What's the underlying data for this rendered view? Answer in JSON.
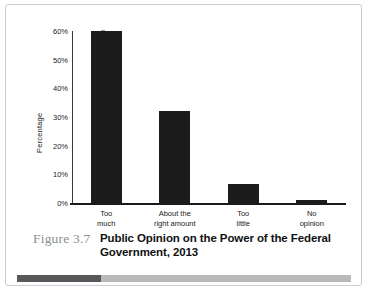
{
  "figure": {
    "number": "Figure 3.7",
    "title_line1": "Public Opinion on the Power of the",
    "title_line2": "Federal Government, 2013",
    "accent_dark": "#58585a",
    "accent_light": "#b9b9b9",
    "bar_color": "#1c1c1c",
    "frame_color": "#c6cdd4"
  },
  "chart_data": {
    "type": "bar",
    "title": "Public Opinion on the Power of the Federal Government, 2013",
    "xlabel": "",
    "ylabel": "Percentage",
    "categories": [
      "Too much",
      "About the right amount",
      "Too little",
      "No opinion"
    ],
    "category_lines": [
      [
        "Too",
        "much"
      ],
      [
        "About the",
        "right amount"
      ],
      [
        "Too",
        "little"
      ],
      [
        "No",
        "opinion"
      ]
    ],
    "values": [
      60,
      32,
      6.5,
      1
    ],
    "ylim": [
      0,
      60
    ],
    "ytick_values": [
      0,
      10,
      20,
      30,
      40,
      50,
      60
    ],
    "ytick_labels": [
      "0%",
      "10%",
      "20%",
      "30%",
      "40%",
      "50%",
      "60%"
    ],
    "grid": false,
    "legend": false
  }
}
